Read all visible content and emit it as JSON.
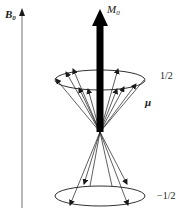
{
  "diagram": {
    "type": "spin precession cones",
    "field_axis": {
      "label_main": "B",
      "label_sub": "0"
    },
    "magnetization": {
      "label_main": "M",
      "label_sub": "0"
    },
    "moment_label": "μ",
    "upper_state": {
      "label": "1/2"
    },
    "lower_state": {
      "label": "−1/2"
    },
    "colors": {
      "axis": "#8a8a8a",
      "ink": "#1a1a1a",
      "background": "#ffffff"
    }
  }
}
